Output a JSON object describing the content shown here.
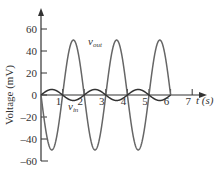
{
  "chart_data": {
    "type": "line",
    "title": "",
    "xlabel": "t (s)",
    "ylabel": "Voltage (mV)",
    "xlim": [
      0,
      7
    ],
    "ylim": [
      -60,
      60
    ],
    "x_ticks": [
      "1",
      "2",
      "3",
      "4",
      "5",
      "6",
      "7"
    ],
    "y_ticks": [
      "60",
      "40",
      "20",
      "0",
      "-20",
      "-40",
      "-60"
    ],
    "grid": false,
    "series": [
      {
        "name": "v_out",
        "label_main": "v",
        "label_sub": "out",
        "formula": "-50*sin(pi*t)",
        "x": [
          0,
          0.5,
          1,
          1.5,
          2,
          2.5,
          3,
          3.5,
          4,
          4.5,
          5,
          5.5,
          6
        ],
        "values": [
          0,
          -50,
          0,
          50,
          0,
          -50,
          0,
          50,
          0,
          -50,
          0,
          50,
          0
        ],
        "color": "#666666"
      },
      {
        "name": "v_in",
        "label_main": "v",
        "label_sub": "in",
        "formula": "5*sin(pi*t)",
        "x": [
          0,
          0.5,
          1,
          1.5,
          2,
          2.5,
          3,
          3.5,
          4,
          4.5,
          5,
          5.5,
          6
        ],
        "values": [
          0,
          5,
          0,
          -5,
          0,
          5,
          0,
          -5,
          0,
          5,
          0,
          -5,
          0
        ],
        "color": "#333333"
      }
    ]
  }
}
